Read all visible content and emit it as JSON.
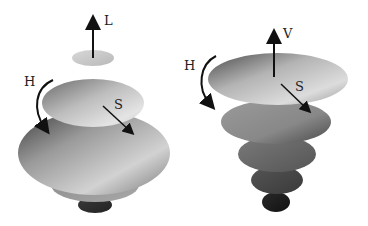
{
  "figure": {
    "left_model": {
      "name": "HLS double cone",
      "labels": {
        "axis": "L",
        "hue": "H",
        "saturation": "S"
      }
    },
    "right_model": {
      "name": "HSV cone",
      "labels": {
        "axis": "V",
        "hue": "H",
        "saturation": "S"
      }
    }
  }
}
